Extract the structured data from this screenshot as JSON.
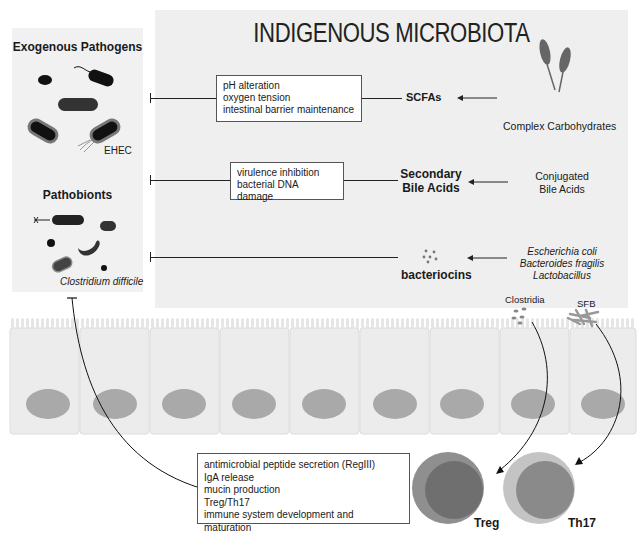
{
  "left_panel": {
    "exogenous_title": "Exogenous Pathogens",
    "exogenous_label": "EHEC",
    "pathobionts_title": "Pathobionts",
    "pathobionts_label": "Clostridium difficile"
  },
  "main_panel": {
    "title": "INDIGENOUS MICROBIOTA",
    "rows": [
      {
        "effects": [
          "pH alteration",
          "oxygen tension",
          "intestinal barrier maintenance"
        ],
        "product": "SCFAs",
        "source": [
          "Complex Carbohydrates"
        ],
        "source_icon": "wheat-icon"
      },
      {
        "effects": [
          "virulence inhibition",
          "bacterial DNA damage"
        ],
        "product": [
          "Secondary",
          "Bile Acids"
        ],
        "source": [
          "Conjugated",
          "Bile Acids"
        ]
      },
      {
        "effects": [],
        "product": "bacteriocins",
        "source": [
          "Escherichia coli",
          "Bacteroides fragilis",
          "Lactobacillus"
        ],
        "product_icon": "dots-icon"
      }
    ],
    "commensals": [
      "Clostridia",
      "SFB"
    ]
  },
  "epithelium": {
    "cell_count": 9,
    "colors": {
      "cell": "#ececec",
      "nucleus": "#a9a9a9",
      "border": "#d8d8d8"
    }
  },
  "host_effects": {
    "items": [
      "antimicrobial peptide secretion (RegIII)",
      "IgA release",
      "mucin production",
      "Treg/Th17",
      "immune system development and maturation"
    ]
  },
  "immune_cells": [
    {
      "label": "Treg",
      "outer": "#8f8f8f",
      "inner": "#6f6f6f"
    },
    {
      "label": "Th17",
      "outer": "#c4c4c4",
      "inner": "#8a8a8a"
    }
  ]
}
